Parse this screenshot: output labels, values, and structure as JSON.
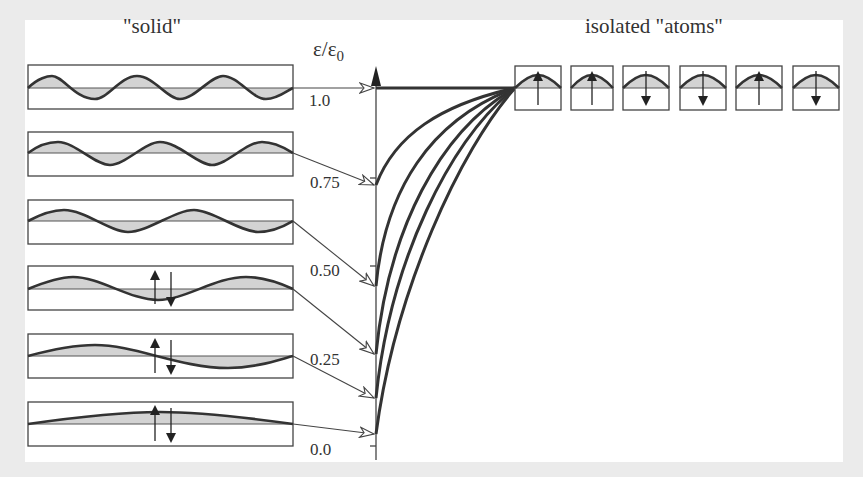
{
  "diagram": {
    "left_title": "\"solid\"",
    "right_title": "isolated \"atoms\"",
    "axis_label": "ε/ε",
    "axis_label_subscript": "0",
    "tick_labels": [
      "1.0",
      "0.75",
      "0.50",
      "0.25",
      "0.0"
    ],
    "solid_states": [
      {
        "index": 0,
        "label": "3 full waves",
        "energy": 1.0
      },
      {
        "index": 1,
        "label": "2.5 waves",
        "energy": 0.75
      },
      {
        "index": 2,
        "label": "2 waves",
        "energy": 0.5
      },
      {
        "index": 3,
        "label": "1.5 waves with spins",
        "energy": 0.3
      },
      {
        "index": 4,
        "label": "1 wave with spins",
        "energy": 0.15
      },
      {
        "index": 5,
        "label": "half wave with spins",
        "energy": 0.05
      }
    ],
    "atoms": [
      {
        "spin": "up"
      },
      {
        "spin": "up"
      },
      {
        "spin": "down"
      },
      {
        "spin": "down"
      },
      {
        "spin": "up"
      },
      {
        "spin": "down"
      }
    ],
    "colors": {
      "background": "#ebebeb",
      "panel": "#ffffff",
      "line": "#333333",
      "fill": "#d3d3d3"
    }
  }
}
